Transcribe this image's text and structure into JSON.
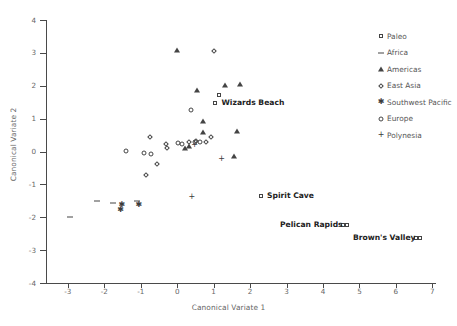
{
  "chart_data": {
    "type": "scatter",
    "title": "",
    "xlabel": "Canonical Variate 1",
    "ylabel": "Canonical Variate 2",
    "xlim": [
      -3.6,
      7.1
    ],
    "ylim": [
      -4,
      4
    ],
    "xticks": [
      -3,
      -2,
      -1,
      0,
      1,
      2,
      3,
      4,
      5,
      6,
      7
    ],
    "yticks": [
      -4,
      -3,
      -2,
      -1,
      0,
      1,
      2,
      3,
      4
    ],
    "grid": false,
    "legend_position": "right",
    "series": [
      {
        "name": "Paleo",
        "marker": "square",
        "points": [
          {
            "x": 1.15,
            "y": 1.72
          },
          {
            "x": 1.05,
            "y": 1.47,
            "label": "Wizards Beach"
          },
          {
            "x": 2.3,
            "y": -1.35,
            "label": "Spirit Cave"
          },
          {
            "x": 4.55,
            "y": -2.25,
            "label": "Pelican Rapids"
          },
          {
            "x": 6.55,
            "y": -2.62,
            "label": "Brown's Valley"
          }
        ]
      },
      {
        "name": "Africa",
        "marker": "dash",
        "points": [
          {
            "x": -2.2,
            "y": -1.52
          },
          {
            "x": -1.75,
            "y": -1.58
          },
          {
            "x": -1.1,
            "y": -1.5
          },
          {
            "x": -2.95,
            "y": -2.0
          }
        ]
      },
      {
        "name": "Americas",
        "marker": "triangle",
        "points": [
          {
            "x": 0.0,
            "y": 3.1
          },
          {
            "x": 0.55,
            "y": 1.88
          },
          {
            "x": 1.3,
            "y": 2.02
          },
          {
            "x": 1.72,
            "y": 2.05
          },
          {
            "x": 0.72,
            "y": 0.92
          },
          {
            "x": 0.7,
            "y": 0.58
          },
          {
            "x": 1.65,
            "y": 0.62
          },
          {
            "x": 1.55,
            "y": -0.15
          },
          {
            "x": 0.32,
            "y": 0.18
          },
          {
            "x": 0.22,
            "y": 0.12
          }
        ]
      },
      {
        "name": "East Asia",
        "marker": "diamond",
        "points": [
          {
            "x": 1.0,
            "y": 3.05
          },
          {
            "x": -0.75,
            "y": 0.45
          },
          {
            "x": -0.3,
            "y": 0.22
          },
          {
            "x": -0.28,
            "y": 0.1
          },
          {
            "x": -0.55,
            "y": -0.38
          },
          {
            "x": -0.85,
            "y": -0.7
          },
          {
            "x": 0.52,
            "y": 0.32
          },
          {
            "x": 0.78,
            "y": 0.3
          },
          {
            "x": 0.92,
            "y": 0.45
          },
          {
            "x": 0.32,
            "y": 0.3
          }
        ]
      },
      {
        "name": "Southwest Pacific",
        "marker": "star",
        "points": [
          {
            "x": -1.55,
            "y": -1.78
          },
          {
            "x": -1.52,
            "y": -1.62
          },
          {
            "x": -1.05,
            "y": -1.62
          }
        ]
      },
      {
        "name": "Europe",
        "marker": "circle",
        "points": [
          {
            "x": 0.38,
            "y": 1.27
          },
          {
            "x": -1.4,
            "y": 0.02
          },
          {
            "x": -0.9,
            "y": -0.05
          },
          {
            "x": -0.72,
            "y": -0.08
          },
          {
            "x": 0.02,
            "y": 0.25
          },
          {
            "x": 0.12,
            "y": 0.22
          },
          {
            "x": 0.5,
            "y": 0.28
          },
          {
            "x": 0.62,
            "y": 0.3
          }
        ]
      },
      {
        "name": "Polynesia",
        "marker": "plus",
        "points": [
          {
            "x": 0.48,
            "y": 0.2
          },
          {
            "x": 1.22,
            "y": -0.22
          },
          {
            "x": 0.4,
            "y": -1.38
          }
        ]
      }
    ]
  },
  "legend": {
    "items": [
      {
        "label": "Paleo",
        "marker": "square"
      },
      {
        "label": "Africa",
        "marker": "dash"
      },
      {
        "label": "Americas",
        "marker": "triangle"
      },
      {
        "label": "East Asia",
        "marker": "diamond"
      },
      {
        "label": "Southwest Pacific",
        "marker": "star"
      },
      {
        "label": "Europe",
        "marker": "circle"
      },
      {
        "label": "Polynesia",
        "marker": "plus"
      }
    ]
  },
  "annotations": [
    {
      "label": "Wizards Beach",
      "x": 1.05,
      "y": 1.47,
      "side": "left"
    },
    {
      "label": "Spirit Cave",
      "x": 2.3,
      "y": -1.35,
      "side": "left"
    },
    {
      "label": "Pelican Rapids",
      "x": 4.55,
      "y": -2.25,
      "side": "right"
    },
    {
      "label": "Brown's Valley",
      "x": 6.55,
      "y": -2.62,
      "side": "right"
    }
  ],
  "glyphs": {
    "star": "✱",
    "plus": "+"
  },
  "colors": {
    "marker": "#3b3b3b",
    "axis": "#4a4a4a",
    "tick_text": "#666666",
    "annotation_text": "#222222",
    "background": "#ffffff"
  }
}
